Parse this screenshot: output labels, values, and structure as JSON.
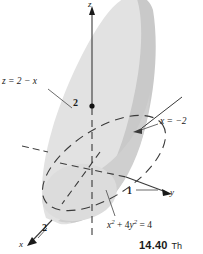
{
  "figure": {
    "domain": "Diagram",
    "kind": "3d-solid-sketch",
    "axes": {
      "z_label": "z",
      "y_label": "y",
      "x_label": "x"
    },
    "ticks": {
      "z_value": "2",
      "y_value": "1",
      "x_value": "2"
    },
    "annotations": {
      "plane_z": "z = 2 − x",
      "plane_x": "x = −2",
      "cylinder_base": "x² + 4y² = 4",
      "cylinder_base_parts": {
        "x": "x",
        "x_exp": "2",
        "plus": " + ",
        "coeff": "4",
        "y": "y",
        "y_exp": "2",
        "equals": " = ",
        "rhs": "4"
      }
    },
    "caption": {
      "number": "14.40",
      "text": "Th"
    },
    "colors": {
      "surface_light": "#e2e2e2",
      "surface_dark": "#c9c9c9",
      "surface_mid": "#d6d6d6",
      "stroke": "#3a3a3a",
      "background": "#ffffff"
    }
  }
}
